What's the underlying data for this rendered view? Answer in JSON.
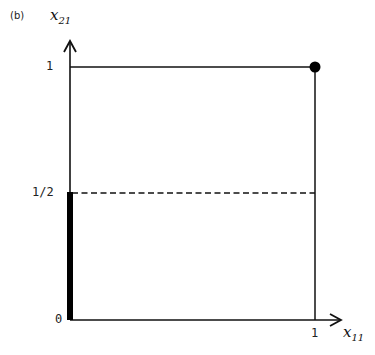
{
  "figure": {
    "panel_label": "(b)",
    "y_axis": {
      "name": "x",
      "subscript": "21"
    },
    "x_axis": {
      "name": "x",
      "subscript": "11"
    },
    "y_ticks": {
      "top": "1",
      "half": "1/2",
      "zero": "0"
    },
    "x_ticks": {
      "one": "1"
    }
  },
  "elements": {
    "unit_square": {
      "x_range": [
        0,
        1
      ],
      "y_range": [
        0,
        1
      ],
      "style": "solid"
    },
    "dashed_line": {
      "y": 0.5,
      "x_range": [
        0,
        1
      ],
      "style": "dashed"
    },
    "thick_segment": {
      "x": 0,
      "y_range": [
        0,
        0.5
      ],
      "style": "thick"
    },
    "point": {
      "x": 1,
      "y": 1,
      "style": "filled-circle"
    }
  },
  "colors": {
    "line": "#111111",
    "background": "#ffffff"
  }
}
